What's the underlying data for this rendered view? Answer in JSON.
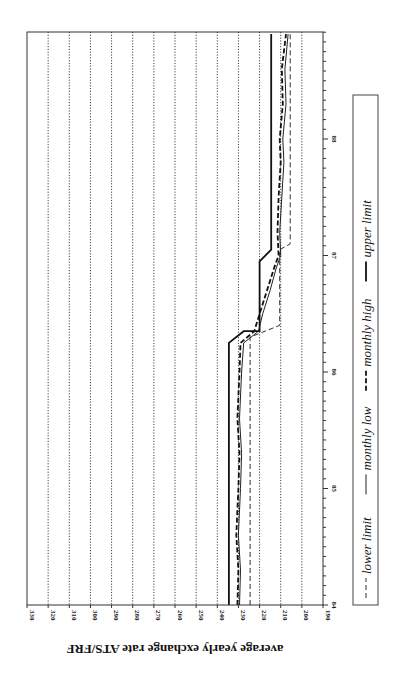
{
  "chart_data": {
    "type": "line",
    "orientation": "rotated-90-clockwise",
    "title": "",
    "xlabel": "",
    "ylabel": "average yearly exchange rate ATS/FRF",
    "ylim": [
      190,
      330
    ],
    "yticks": [
      330,
      320,
      310,
      300,
      290,
      280,
      270,
      260,
      250,
      240,
      230,
      220,
      210,
      200,
      190
    ],
    "xlim": [
      84,
      88.9
    ],
    "xticks": [
      84,
      85,
      86,
      87,
      88
    ],
    "xtick_labels": [
      "84",
      "85",
      "86",
      "87",
      "88"
    ],
    "minor_ticks": "monthly",
    "grid": "horizontal dotted at every y tick",
    "legend": {
      "position": "bottom (rotated, right side)",
      "entries": [
        {
          "label": "lower limit",
          "style": "dashed"
        },
        {
          "label": "monthly low",
          "style": "solid"
        },
        {
          "label": "monthly high",
          "style": "bold-dashed"
        },
        {
          "label": "upper limit",
          "style": "bold-solid"
        }
      ]
    },
    "series": [
      {
        "name": "upper limit",
        "style": "bold-solid",
        "x": [
          84.0,
          86.25,
          86.25,
          86.35,
          86.35,
          86.95,
          87.05,
          88.9
        ],
        "values": [
          234.5,
          234.5,
          234.5,
          227.5,
          220.0,
          220.0,
          214.5,
          214.5
        ]
      },
      {
        "name": "lower limit",
        "style": "dashed",
        "x": [
          84.0,
          86.3,
          86.3,
          86.4,
          86.4,
          87.05,
          87.1,
          88.9
        ],
        "values": [
          224.5,
          224.5,
          224.5,
          210.5,
          210.5,
          210.5,
          205.5,
          205.5
        ]
      },
      {
        "name": "monthly high",
        "style": "bold-dashed",
        "x": [
          84.0,
          84.3,
          84.6,
          85.0,
          85.3,
          85.6,
          86.0,
          86.25,
          86.35,
          86.5,
          86.7,
          86.9,
          87.0,
          87.2,
          87.5,
          87.8,
          88.0,
          88.3,
          88.6,
          88.9
        ],
        "values": [
          230.5,
          230.0,
          231.0,
          230.0,
          229.5,
          230.5,
          229.5,
          229.0,
          222.5,
          220.0,
          216.5,
          213.0,
          211.0,
          211.5,
          211.0,
          210.0,
          210.5,
          209.0,
          209.5,
          207.5
        ]
      },
      {
        "name": "monthly low",
        "style": "solid",
        "x": [
          84.0,
          84.3,
          84.6,
          85.0,
          85.3,
          85.6,
          86.0,
          86.25,
          86.35,
          86.5,
          86.7,
          86.9,
          87.0,
          87.2,
          87.5,
          87.8,
          88.0,
          88.3,
          88.6,
          88.9
        ],
        "values": [
          229.5,
          229.0,
          230.0,
          229.0,
          228.5,
          229.5,
          228.5,
          227.5,
          220.5,
          218.5,
          215.0,
          212.0,
          210.0,
          210.5,
          209.5,
          208.5,
          209.0,
          207.5,
          208.0,
          206.5
        ]
      }
    ]
  }
}
